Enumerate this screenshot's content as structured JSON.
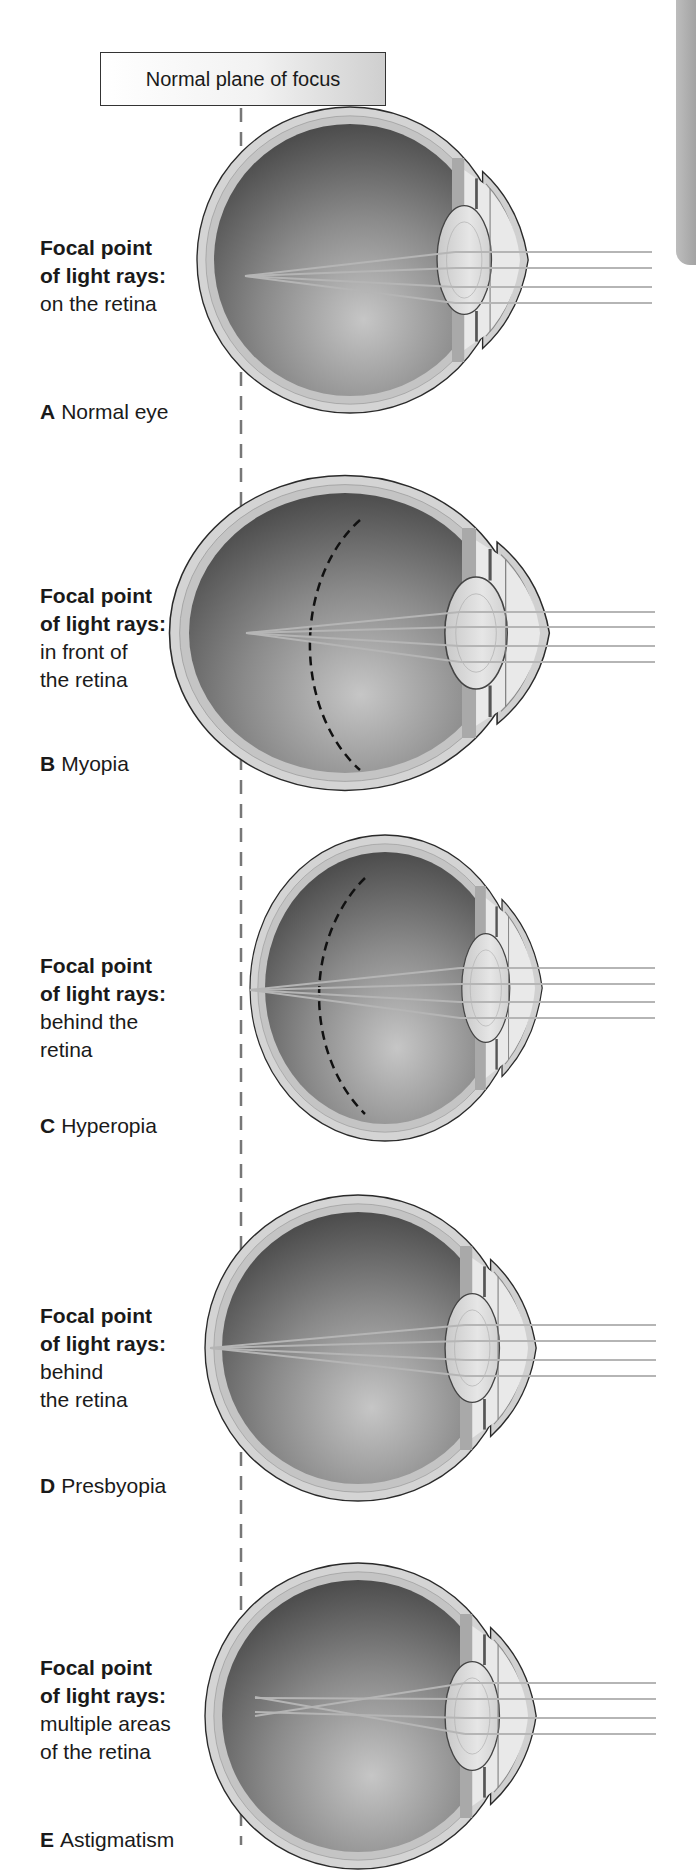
{
  "header": {
    "title": "Normal plane of focus"
  },
  "panels": [
    {
      "letter": "A",
      "name": "Normal eye",
      "focal_title_1": "Focal point",
      "focal_title_2": "of light rays:",
      "focal_desc": "on the retina"
    },
    {
      "letter": "B",
      "name": "Myopia",
      "focal_title_1": "Focal point",
      "focal_title_2": "of light rays:",
      "focal_desc": "in front of\nthe retina"
    },
    {
      "letter": "C",
      "name": "Hyperopia",
      "focal_title_1": "Focal point",
      "focal_title_2": "of light rays:",
      "focal_desc": "behind the\nretina"
    },
    {
      "letter": "D",
      "name": "Presbyopia",
      "focal_title_1": "Focal point",
      "focal_title_2": "of light rays:",
      "focal_desc": "behind\nthe retina"
    },
    {
      "letter": "E",
      "name": "Astigmatism",
      "focal_title_1": "Focal point",
      "focal_title_2": "of light rays:",
      "focal_desc": "multiple areas\nof the retina"
    }
  ],
  "colors": {
    "outline": "#2a2a2a",
    "sclera": "#d6d6d6",
    "interior_dark": "#4a4a4a",
    "interior_light": "#bdbdbd",
    "rays": "#b0b0b0",
    "dashed_line": "#777777"
  }
}
